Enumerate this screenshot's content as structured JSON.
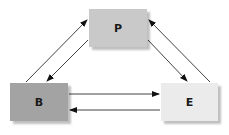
{
  "diagram": {
    "nodes": [
      {
        "id": "P",
        "label": "P",
        "fill": "#c9c9c9",
        "x": 89,
        "y": 9,
        "w": 58,
        "h": 38
      },
      {
        "id": "B",
        "label": "B",
        "fill": "#a3a3a3",
        "x": 10,
        "y": 83,
        "w": 58,
        "h": 38
      },
      {
        "id": "E",
        "label": "E",
        "fill": "#ebebeb",
        "x": 161,
        "y": 83,
        "w": 57,
        "h": 38
      }
    ],
    "edges": [
      {
        "from": "B",
        "to": "P"
      },
      {
        "from": "P",
        "to": "B"
      },
      {
        "from": "P",
        "to": "E"
      },
      {
        "from": "E",
        "to": "P"
      },
      {
        "from": "B",
        "to": "E"
      },
      {
        "from": "E",
        "to": "B"
      }
    ],
    "edge_color": "#111111"
  }
}
